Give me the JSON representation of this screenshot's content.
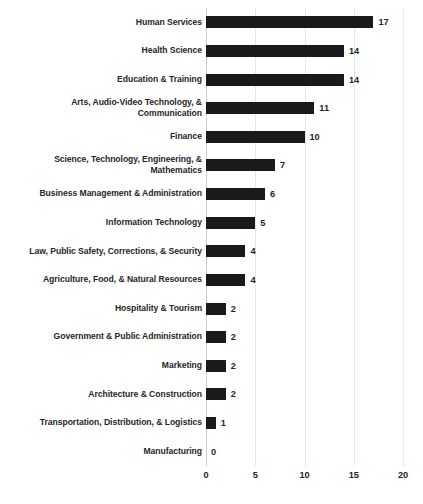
{
  "chart_data": {
    "type": "bar",
    "orientation": "horizontal",
    "title": "",
    "subtitle": "",
    "xlabel": "",
    "ylabel": "",
    "xlim": [
      0,
      20
    ],
    "xticks": [
      0,
      5,
      10,
      15,
      20
    ],
    "grid": "vertical",
    "legend": "none",
    "bar_color": "#1a1a1a",
    "gridline_color": "#e6e6e6",
    "text_color": "#262626",
    "categories": [
      "Human Services",
      "Health Science",
      "Education & Training",
      "Arts, Audio-Video Technology, & Communication",
      "Finance",
      "Science, Technology, Engineering, & Mathematics",
      "Business Management & Administration",
      "Information Technology",
      "Law, Public Safety, Corrections, & Security",
      "Agriculture, Food, & Natural Resources",
      "Hospitality & Tourism",
      "Government & Public Administration",
      "Marketing",
      "Architecture & Construction",
      "Transportation, Distribution, & Logistics",
      "Manufacturing"
    ],
    "values": [
      17,
      14,
      14,
      11,
      10,
      7,
      6,
      5,
      4,
      4,
      2,
      2,
      2,
      2,
      1,
      0
    ],
    "data_labels": [
      "17",
      "14",
      "14",
      "11",
      "10",
      "7",
      "6",
      "5",
      "4",
      "4",
      "2",
      "2",
      "2",
      "2",
      "1",
      "0"
    ]
  },
  "axis": {
    "tick_labels": [
      "0",
      "5",
      "10",
      "15",
      "20"
    ]
  }
}
